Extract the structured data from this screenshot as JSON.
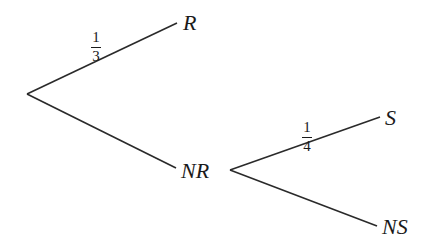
{
  "diagram": {
    "type": "probability-tree",
    "nodes": {
      "R": "R",
      "NR": "NR",
      "S": "S",
      "NS": "NS"
    },
    "branches": [
      {
        "from": "root",
        "to": "R",
        "probability": {
          "num": "1",
          "den": "3"
        }
      },
      {
        "from": "root",
        "to": "NR",
        "probability": null
      },
      {
        "from": "NR",
        "to": "S",
        "probability": {
          "num": "1",
          "den": "4"
        }
      },
      {
        "from": "NR",
        "to": "NS",
        "probability": null
      }
    ],
    "line_color": "#2a2a2a"
  }
}
